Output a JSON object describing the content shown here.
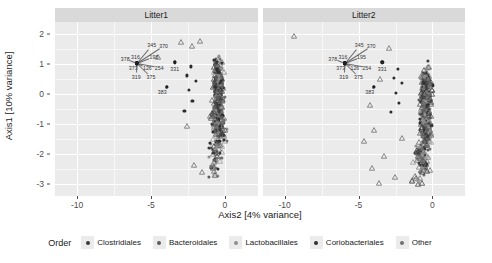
{
  "chart_data": {
    "type": "scatter",
    "title": "",
    "xlabel": "Axis2 [4% variance]",
    "ylabel": "Axis1 [10% variance]",
    "xlim": [
      -11.5,
      2.2
    ],
    "ylim": [
      -3.4,
      2.4
    ],
    "xticks": [
      -10,
      -5,
      0
    ],
    "yticks": [
      2,
      1,
      0,
      -1,
      -2,
      -3
    ],
    "xtick_labels": [
      "-10",
      "-5",
      "0"
    ],
    "ytick_labels": [
      "2",
      "1",
      "0",
      "-1",
      "-2",
      "-3"
    ],
    "grid": true,
    "legend_position": "bottom",
    "facet_labels": [
      "Litter1",
      "Litter2"
    ],
    "legend": {
      "title": "Order",
      "entries": [
        {
          "name": "Clostridiales",
          "color": "#3b3b3b"
        },
        {
          "name": "Bacteroidales",
          "color": "#5c5c5c"
        },
        {
          "name": "Lactobacillales",
          "color": "#8f8f8f"
        },
        {
          "name": "Coriobacteriales",
          "color": "#2f2f2f"
        },
        {
          "name": "Other",
          "color": "#707070"
        }
      ]
    },
    "panels": [
      {
        "label": "Litter1",
        "annotations": [
          {
            "id": "378",
            "x": -6.75,
            "y": 1.18,
            "anchor_x": -5.95,
            "anchor_y": 1.02
          },
          {
            "id": "316",
            "x": -6.05,
            "y": 1.22,
            "anchor_x": -5.95,
            "anchor_y": 1.02
          },
          {
            "id": "345",
            "x": -4.95,
            "y": 1.62,
            "anchor_x": -5.95,
            "anchor_y": 1.02
          },
          {
            "id": "370",
            "x": -4.15,
            "y": 1.6,
            "anchor_x": -5.95,
            "anchor_y": 1.02
          },
          {
            "id": "195",
            "x": -4.8,
            "y": 1.24,
            "anchor_x": -5.95,
            "anchor_y": 1.02
          },
          {
            "id": "373",
            "x": -6.2,
            "y": 0.86,
            "anchor_x": -5.95,
            "anchor_y": 1.02
          },
          {
            "id": "126",
            "x": -5.25,
            "y": 0.86,
            "anchor_x": -5.95,
            "anchor_y": 1.02
          },
          {
            "id": "254",
            "x": -4.45,
            "y": 0.88,
            "anchor_x": -5.95,
            "anchor_y": 1.02
          },
          {
            "id": "331",
            "x": -3.4,
            "y": 0.84,
            "anchor_x": -3.4,
            "anchor_y": 1.06
          },
          {
            "id": "319",
            "x": -6.0,
            "y": 0.56,
            "anchor_x": -5.95,
            "anchor_y": 1.02
          },
          {
            "id": "375",
            "x": -5.0,
            "y": 0.56,
            "anchor_x": -5.95,
            "anchor_y": 1.02
          },
          {
            "id": "383",
            "x": -4.25,
            "y": 0.07,
            "anchor_x": -3.95,
            "anchor_y": 0.24
          }
        ]
      },
      {
        "label": "Litter2",
        "annotations": [
          {
            "id": "378",
            "x": -6.75,
            "y": 1.18,
            "anchor_x": -5.95,
            "anchor_y": 1.02
          },
          {
            "id": "316",
            "x": -6.05,
            "y": 1.22,
            "anchor_x": -5.95,
            "anchor_y": 1.02
          },
          {
            "id": "345",
            "x": -4.95,
            "y": 1.62,
            "anchor_x": -5.95,
            "anchor_y": 1.02
          },
          {
            "id": "370",
            "x": -4.15,
            "y": 1.6,
            "anchor_x": -5.95,
            "anchor_y": 1.02
          },
          {
            "id": "195",
            "x": -4.8,
            "y": 1.24,
            "anchor_x": -5.95,
            "anchor_y": 1.02
          },
          {
            "id": "373",
            "x": -6.2,
            "y": 0.86,
            "anchor_x": -5.95,
            "anchor_y": 1.02
          },
          {
            "id": "126",
            "x": -5.25,
            "y": 0.86,
            "anchor_x": -5.95,
            "anchor_y": 1.02
          },
          {
            "id": "254",
            "x": -4.45,
            "y": 0.88,
            "anchor_x": -5.95,
            "anchor_y": 1.02
          },
          {
            "id": "331",
            "x": -3.4,
            "y": 0.84,
            "anchor_x": -3.4,
            "anchor_y": 1.06
          },
          {
            "id": "319",
            "x": -6.0,
            "y": 0.56,
            "anchor_x": -5.95,
            "anchor_y": 1.02
          },
          {
            "id": "375",
            "x": -5.0,
            "y": 0.56,
            "anchor_x": -5.95,
            "anchor_y": 1.02
          },
          {
            "id": "383",
            "x": -4.25,
            "y": 0.07,
            "anchor_x": -3.95,
            "anchor_y": 0.24
          }
        ]
      }
    ]
  }
}
